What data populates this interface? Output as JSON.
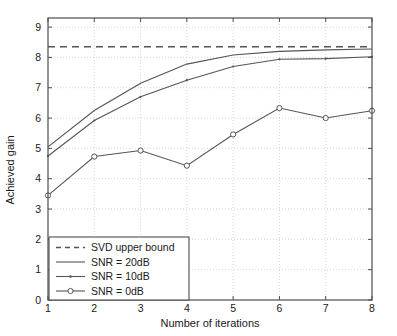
{
  "chart_data": {
    "type": "line",
    "title": "",
    "xlabel": "Number of iterations",
    "ylabel": "Achieved gain",
    "xlim": [
      1,
      8
    ],
    "ylim": [
      0,
      9.3
    ],
    "xticks": [
      1,
      2,
      3,
      4,
      5,
      6,
      7,
      8
    ],
    "yticks": [
      0,
      1,
      2,
      3,
      4,
      5,
      6,
      7,
      8,
      9
    ],
    "grid": true,
    "grid_style": "dotted",
    "legend_position": "lower left",
    "x": [
      1,
      2,
      3,
      4,
      5,
      6,
      7,
      8
    ],
    "series": [
      {
        "name": "SVD upper bound",
        "style": "dashed",
        "marker": "none",
        "color": "#555555",
        "constant_value": 8.35,
        "values": [
          8.35,
          8.35,
          8.35,
          8.35,
          8.35,
          8.35,
          8.35,
          8.35
        ]
      },
      {
        "name": "SNR = 20dB",
        "style": "solid",
        "marker": "none",
        "color": "#555555",
        "values": [
          5.05,
          6.25,
          7.15,
          7.78,
          8.08,
          8.2,
          8.25,
          8.28
        ]
      },
      {
        "name": "SNR = 10dB",
        "style": "solid",
        "marker": "dot",
        "color": "#555555",
        "values": [
          4.75,
          5.92,
          6.7,
          7.25,
          7.7,
          7.94,
          7.96,
          8.02
        ]
      },
      {
        "name": "SNR = 0dB",
        "style": "solid",
        "marker": "circle",
        "color": "#555555",
        "values": [
          3.45,
          4.73,
          4.93,
          4.43,
          5.46,
          6.33,
          6.0,
          6.24
        ]
      }
    ]
  },
  "xtick_labels": [
    "1",
    "2",
    "3",
    "4",
    "5",
    "6",
    "7",
    "8"
  ],
  "ytick_labels": [
    "0",
    "1",
    "2",
    "3",
    "4",
    "5",
    "6",
    "7",
    "8",
    "9"
  ],
  "labels": {
    "x_axis": "Number of iterations",
    "y_axis": "Achieved gain"
  },
  "legend": {
    "items": [
      {
        "label": "SVD upper bound",
        "style": "dashed",
        "marker": "none"
      },
      {
        "label": "SNR = 20dB",
        "style": "solid",
        "marker": "none"
      },
      {
        "label": "SNR = 10dB",
        "style": "solid",
        "marker": "dot"
      },
      {
        "label": "SNR = 0dB",
        "style": "solid",
        "marker": "circle"
      }
    ]
  },
  "colors": {
    "line": "#555555",
    "axis": "#4d4d4d",
    "grid": "#cccccc",
    "text": "#1a1a1a",
    "background": "#ffffff"
  }
}
